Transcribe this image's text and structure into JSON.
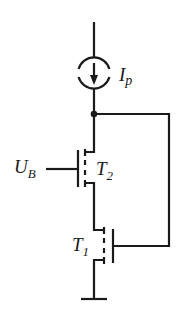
{
  "diagram": {
    "type": "circuit-schematic",
    "stroke_color": "#1a1a1a",
    "background": "#ffffff",
    "labels": {
      "current_source": {
        "main": "I",
        "sub": "p"
      },
      "bias_voltage": {
        "main": "U",
        "sub": "B"
      },
      "transistor_top": {
        "main": "T",
        "sub": "2"
      },
      "transistor_bottom": {
        "main": "T",
        "sub": "1"
      }
    },
    "components": [
      {
        "id": "current-source",
        "kind": "current source",
        "label": "Ip",
        "direction": "down"
      },
      {
        "id": "T2",
        "kind": "MOSFET (enhancement)",
        "gate": "UB"
      },
      {
        "id": "T1",
        "kind": "MOSFET (enhancement)",
        "gate": "connected to node below current source"
      },
      {
        "id": "node",
        "kind": "junction dot"
      },
      {
        "id": "ground",
        "kind": "ground"
      }
    ]
  }
}
